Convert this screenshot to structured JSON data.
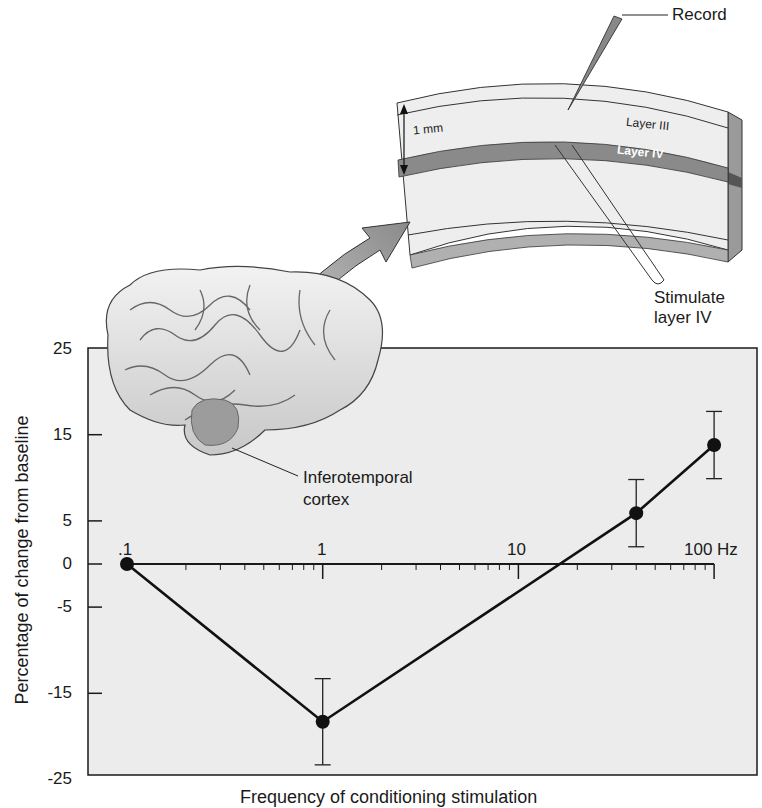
{
  "annotations": {
    "record": "Record",
    "stimulate_line1": "Stimulate",
    "stimulate_line2": "layer IV",
    "layer3": "Layer III",
    "layer4": "Layer IV",
    "thickness": "1 mm",
    "region_line1": "Inferotemporal",
    "region_line2": "cortex"
  },
  "colors": {
    "plot_bg": "#ececec",
    "axis": "#1a1a1a",
    "line": "#111111",
    "layer4": "#8a8a8a",
    "cortex_slab": "#e6e6e6",
    "arrow": "#9a9a9a",
    "brain": "#dcdcdc",
    "it_region": "#9c9c9c"
  },
  "chart_data": {
    "type": "line",
    "title": "",
    "xlabel": "Frequency of conditioning stimulation",
    "ylabel": "Percentage of change from baseline",
    "x_scale": "log",
    "x_ticks": [
      ".1",
      "1",
      "10",
      "100 Hz"
    ],
    "x_tick_values": [
      0.1,
      1,
      10,
      100
    ],
    "y_ticks": [
      "25",
      "15",
      "5",
      "0",
      "-5",
      "-15",
      "-25"
    ],
    "y_tick_values": [
      25,
      15,
      5,
      0,
      -5,
      -15,
      -25
    ],
    "ylim": [
      -25,
      25
    ],
    "xlim": [
      0.1,
      100
    ],
    "grid": false,
    "legend": null,
    "series": [
      {
        "name": "LTP/LTD response",
        "x": [
          0.1,
          1,
          40,
          100
        ],
        "y": [
          0,
          -18.3,
          5.9,
          13.8
        ],
        "error": [
          0,
          5.0,
          3.9,
          3.9
        ]
      }
    ]
  }
}
